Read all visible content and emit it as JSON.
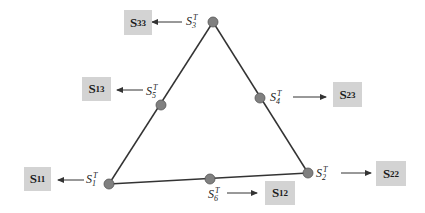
{
  "diagram": {
    "type": "triangle-node-mapping",
    "colors": {
      "background": "#ffffff",
      "box_fill": "#d3d3d3",
      "node_fill": "#808080",
      "line": "#333333"
    },
    "vertices": [
      {
        "id": "S3T",
        "base": "S",
        "sub": "3",
        "sup": "T",
        "x": 213,
        "y": 22,
        "role": "top-vertex"
      },
      {
        "id": "S1T",
        "base": "S",
        "sub": "1",
        "sup": "T",
        "x": 109,
        "y": 184,
        "role": "bottom-left-vertex"
      },
      {
        "id": "S2T",
        "base": "S",
        "sub": "2",
        "sup": "T",
        "x": 308,
        "y": 173,
        "role": "bottom-right-vertex"
      },
      {
        "id": "S5T",
        "base": "S",
        "sub": "5",
        "sup": "T",
        "x": 161,
        "y": 105,
        "role": "left-edge-midpoint"
      },
      {
        "id": "S4T",
        "base": "S",
        "sub": "4",
        "sup": "T",
        "x": 260,
        "y": 98,
        "role": "right-edge-midpoint"
      },
      {
        "id": "S6T",
        "base": "S",
        "sub": "6",
        "sup": "T",
        "x": 210,
        "y": 179,
        "role": "bottom-edge-midpoint"
      }
    ],
    "edges": [
      [
        "S1T",
        "S3T"
      ],
      [
        "S3T",
        "S2T"
      ],
      [
        "S1T",
        "S2T"
      ]
    ],
    "boxes": [
      {
        "id": "S33",
        "base": "S",
        "sub": "33",
        "from": "S3T"
      },
      {
        "id": "S13",
        "base": "S",
        "sub": "13",
        "from": "S5T"
      },
      {
        "id": "S23",
        "base": "S",
        "sub": "23",
        "from": "S4T"
      },
      {
        "id": "S11",
        "base": "S",
        "sub": "11",
        "from": "S1T"
      },
      {
        "id": "S22",
        "base": "S",
        "sub": "22",
        "from": "S2T"
      },
      {
        "id": "S12",
        "base": "S",
        "sub": "12",
        "from": "S6T"
      }
    ],
    "labels": {
      "S3T": {
        "base": "S",
        "sub": "3",
        "sup": "T"
      },
      "S5T": {
        "base": "S",
        "sub": "5",
        "sup": "T"
      },
      "S4T": {
        "base": "S",
        "sub": "4",
        "sup": "T"
      },
      "S1T": {
        "base": "S",
        "sub": "1",
        "sup": "T"
      },
      "S2T": {
        "base": "S",
        "sub": "2",
        "sup": "T"
      },
      "S6T": {
        "base": "S",
        "sub": "6",
        "sup": "T"
      },
      "S33": {
        "base": "S",
        "sub": "33"
      },
      "S13": {
        "base": "S",
        "sub": "13"
      },
      "S23": {
        "base": "S",
        "sub": "23"
      },
      "S11": {
        "base": "S",
        "sub": "11"
      },
      "S22": {
        "base": "S",
        "sub": "22"
      },
      "S12": {
        "base": "S",
        "sub": "12"
      }
    }
  }
}
